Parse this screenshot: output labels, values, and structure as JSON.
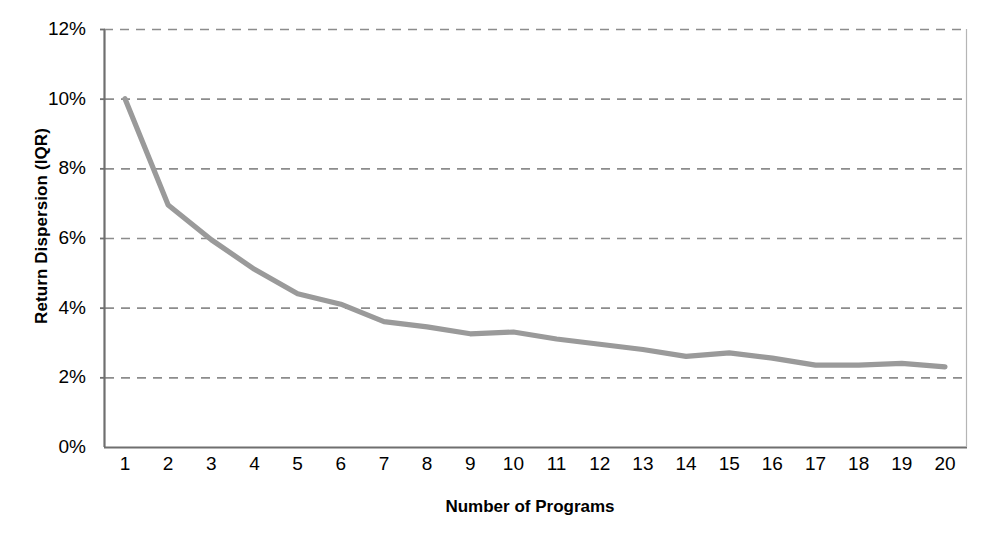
{
  "chart_data": {
    "type": "line",
    "title": "",
    "xlabel": "Number of Programs",
    "ylabel": "Return Dispersion (IQR)",
    "x": [
      1,
      2,
      3,
      4,
      5,
      6,
      7,
      8,
      9,
      10,
      11,
      12,
      13,
      14,
      15,
      16,
      17,
      18,
      19,
      20
    ],
    "values": [
      10.0,
      6.95,
      5.95,
      5.1,
      4.4,
      4.1,
      3.6,
      3.45,
      3.25,
      3.3,
      3.1,
      2.95,
      2.8,
      2.6,
      2.7,
      2.55,
      2.35,
      2.35,
      2.4,
      2.3
    ],
    "x_tick_labels": [
      "1",
      "2",
      "3",
      "4",
      "5",
      "6",
      "7",
      "8",
      "9",
      "10",
      "11",
      "12",
      "13",
      "14",
      "15",
      "16",
      "17",
      "18",
      "19",
      "20"
    ],
    "y_tick_labels": [
      "0%",
      "2%",
      "4%",
      "6%",
      "8%",
      "10%",
      "12%"
    ],
    "y_tick_values": [
      0,
      2,
      4,
      6,
      8,
      10,
      12
    ],
    "ylim": [
      0,
      12
    ],
    "xlim": [
      1,
      20
    ],
    "grid": "horizontal-dashed",
    "legend": "none",
    "series": [
      {
        "name": "Return Dispersion (IQR)",
        "color": "#9a9a9a",
        "values": [
          10.0,
          6.95,
          5.95,
          5.1,
          4.4,
          4.1,
          3.6,
          3.45,
          3.25,
          3.3,
          3.1,
          2.95,
          2.8,
          2.6,
          2.7,
          2.55,
          2.35,
          2.35,
          2.4,
          2.3
        ]
      }
    ],
    "colors": {
      "line": "#9a9a9a",
      "grid": "#8c8c8c",
      "axis": "#6f6f6f",
      "text": "#000000",
      "background": "#ffffff"
    }
  }
}
